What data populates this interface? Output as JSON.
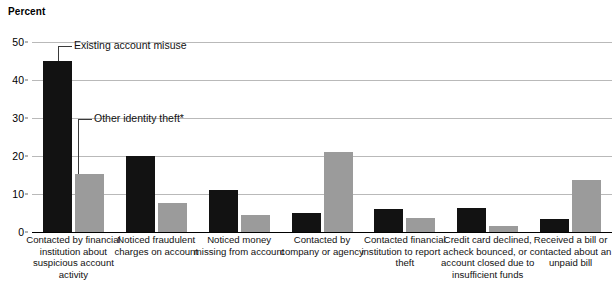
{
  "chart_data": {
    "type": "bar",
    "title": "",
    "ylabel": "Percent",
    "xlabel": "",
    "ylim": [
      0,
      50
    ],
    "yticks": [
      0,
      10,
      20,
      30,
      40,
      50
    ],
    "grid": true,
    "legend_position": "annotated-callouts",
    "categories": [
      "Contacted by financial institution about suspicious account activity",
      "Noticed fraudulent charges on account",
      "Noticed money missing from account",
      "Contacted by company or agency",
      "Contacted financial institution to report a theft",
      "Credit card declined, check bounced, or account  closed due to insufficient funds",
      "Received a bill or contacted about an unpaid bill"
    ],
    "series": [
      {
        "name": "Existing account misuse",
        "color": "#121212",
        "values": [
          45,
          20,
          11,
          5,
          6,
          6.3,
          3.5
        ]
      },
      {
        "name": "Other identity theft*",
        "color": "#9b9b9b",
        "values": [
          15.3,
          7.6,
          4.6,
          21,
          3.6,
          1.6,
          13.8
        ]
      }
    ],
    "annotations": [
      {
        "label": "Existing account misuse",
        "target_series": 0,
        "target_category": 0
      },
      {
        "label": "Other identity theft*",
        "target_series": 1,
        "target_category": 0
      }
    ]
  }
}
